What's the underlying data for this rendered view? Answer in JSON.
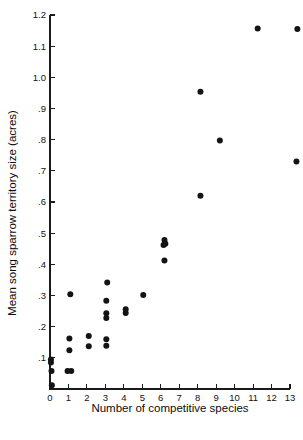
{
  "chart_data": {
    "type": "scatter",
    "title": "",
    "xlabel": "Number of competitive species",
    "ylabel": "Mean song sparrow territory size (acres)",
    "xlim": [
      0,
      13
    ],
    "ylim": [
      0,
      1.2
    ],
    "grid": false,
    "legend": null,
    "xticks": [
      "0",
      "1",
      "2",
      "3",
      "4",
      "5",
      "6",
      "7",
      "8",
      "9",
      "10",
      "11",
      "12",
      "13"
    ],
    "xtick_values": [
      0,
      1,
      2,
      3,
      4,
      5,
      6,
      7,
      8,
      9,
      10,
      11,
      12,
      13
    ],
    "yticks": [
      ".1",
      ".2",
      ".3",
      ".4",
      ".5",
      ".6",
      ".7",
      ".8",
      ".9",
      "1.0",
      "1.1",
      "1.2"
    ],
    "ytick_values": [
      0.1,
      0.2,
      0.3,
      0.4,
      0.5,
      0.6,
      0.7,
      0.8,
      0.9,
      1.0,
      1.1,
      1.2
    ],
    "marker": "filled-circle",
    "marker_color": "#141414",
    "marker_size": 3.0,
    "points": [
      {
        "x": 0.05,
        "y": 0.095
      },
      {
        "x": 0.05,
        "y": 0.085
      },
      {
        "x": 0.08,
        "y": 0.058
      },
      {
        "x": 0.1,
        "y": 0.012
      },
      {
        "x": 0.95,
        "y": 0.058
      },
      {
        "x": 1.15,
        "y": 0.058
      },
      {
        "x": 1.05,
        "y": 0.124
      },
      {
        "x": 1.05,
        "y": 0.162
      },
      {
        "x": 1.1,
        "y": 0.304
      },
      {
        "x": 2.1,
        "y": 0.137
      },
      {
        "x": 2.1,
        "y": 0.17
      },
      {
        "x": 3.05,
        "y": 0.139
      },
      {
        "x": 3.05,
        "y": 0.16
      },
      {
        "x": 3.05,
        "y": 0.228
      },
      {
        "x": 3.05,
        "y": 0.243
      },
      {
        "x": 3.05,
        "y": 0.283
      },
      {
        "x": 3.1,
        "y": 0.342
      },
      {
        "x": 4.1,
        "y": 0.244
      },
      {
        "x": 4.1,
        "y": 0.256
      },
      {
        "x": 5.05,
        "y": 0.302
      },
      {
        "x": 6.2,
        "y": 0.412
      },
      {
        "x": 6.15,
        "y": 0.462
      },
      {
        "x": 6.25,
        "y": 0.466
      },
      {
        "x": 6.2,
        "y": 0.478
      },
      {
        "x": 8.15,
        "y": 0.62
      },
      {
        "x": 8.15,
        "y": 0.954
      },
      {
        "x": 9.2,
        "y": 0.797
      },
      {
        "x": 11.25,
        "y": 1.157
      },
      {
        "x": 13.35,
        "y": 0.73
      },
      {
        "x": 13.4,
        "y": 1.155
      }
    ]
  },
  "layout": {
    "plot_left_px": 50,
    "plot_bottom_px": 389,
    "plot_top_px": 15,
    "plot_right_px": 290,
    "y_axis_top_value": 1.2,
    "x_axis_max_value": 13
  }
}
